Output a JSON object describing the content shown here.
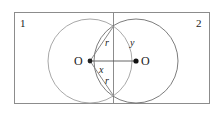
{
  "figure": {
    "type": "geometry-diagram",
    "colors": {
      "border": "#8c8c8c",
      "divider": "#8c8c8c",
      "circle_left": "#9a9a9a",
      "circle_right": "#6e6e6e",
      "chord": "#7a7a7a",
      "axis": "#555555",
      "dot": "#222222",
      "text": "#1a1a1a",
      "background": "#ffffff"
    },
    "rectangle": {
      "x": 14,
      "y": 12,
      "width": 196,
      "height": 92
    },
    "divider_x": 113,
    "circles": [
      {
        "name": "left-circle",
        "cx": 90,
        "cy": 61,
        "r": 42
      },
      {
        "name": "right-circle",
        "cx": 136,
        "cy": 61,
        "r": 42
      }
    ],
    "intersections": [
      {
        "name": "upper-intersection",
        "x": 113,
        "y": 27
      },
      {
        "name": "lower-intersection",
        "x": 113,
        "y": 95
      }
    ],
    "centers": [
      {
        "name": "left-center",
        "x": 90,
        "y": 61
      },
      {
        "name": "right-center",
        "x": 136,
        "y": 61
      }
    ]
  },
  "labels": {
    "region_left": "1",
    "region_right": "2",
    "center_left": "O",
    "center_right": "O",
    "radius_upper": "r",
    "radius_lower": "r",
    "segment_x": "x",
    "segment_y": "y"
  }
}
